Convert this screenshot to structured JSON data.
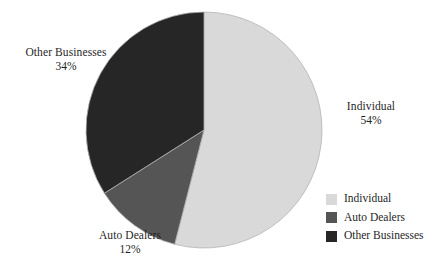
{
  "chart_data": {
    "type": "pie",
    "title": "",
    "subtitle": "",
    "xlabel": "",
    "ylabel": "",
    "categories": [
      "Individual",
      "Auto Dealers",
      "Other Businesses"
    ],
    "values": [
      54,
      12,
      34
    ],
    "value_unit": "%",
    "start_angle_deg": 0,
    "direction": "clockwise",
    "grid": false,
    "legend_position": "bottom-right",
    "slices": [
      {
        "label": "Individual",
        "value": 54,
        "value_text": "54%",
        "color": "#d9d9d9",
        "start_deg": 0,
        "end_deg": 194.4
      },
      {
        "label": "Auto Dealers",
        "value": 12,
        "value_text": "12%",
        "color": "#555555",
        "start_deg": 194.4,
        "end_deg": 237.6
      },
      {
        "label": "Other Businesses",
        "value": 34,
        "value_text": "34%",
        "color": "#262626",
        "start_deg": 237.6,
        "end_deg": 360
      }
    ],
    "annotations": [
      {
        "text": "Individual",
        "value_text": "54%",
        "position": "right"
      },
      {
        "text": "Auto Dealers",
        "value_text": "12%",
        "position": "bottom-left"
      },
      {
        "text": "Other Businesses",
        "value_text": "34%",
        "position": "top-left"
      }
    ]
  },
  "callouts": {
    "other": {
      "category": "Other Businesses",
      "percent": "34%"
    },
    "individual": {
      "category": "Individual",
      "percent": "54%"
    },
    "auto": {
      "category": "Auto Dealers",
      "percent": "12%"
    }
  },
  "legend": {
    "items": [
      {
        "label": "Individual",
        "color": "#d9d9d9"
      },
      {
        "label": "Auto Dealers",
        "color": "#555555"
      },
      {
        "label": "Other Businesses",
        "color": "#262626"
      }
    ]
  },
  "colors": {
    "background": "#ffffff",
    "text": "#1f1f1f",
    "slice_individual": "#d9d9d9",
    "slice_auto_dealers": "#555555",
    "slice_other_businesses": "#262626",
    "slice_outline": "#b4b4b4"
  },
  "geometry": {
    "center_x": 204,
    "center_y": 130,
    "radius": 118
  }
}
